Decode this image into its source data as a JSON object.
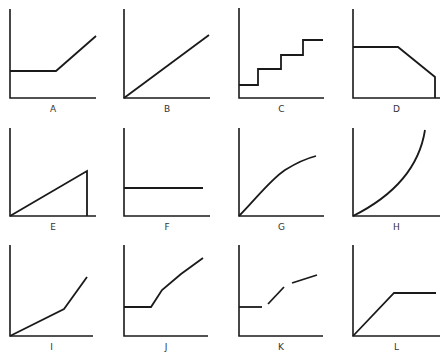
{
  "figure": {
    "line_color": "#1a1a1a",
    "label_color": "#333333"
  },
  "panels": [
    {
      "label": "A",
      "shape": "flat then linear rise",
      "origin": [
        10,
        98
      ],
      "x_end": 96,
      "y_top": 9,
      "segments": [
        [
          [
            10,
            71
          ],
          [
            56,
            71
          ],
          [
            96,
            36
          ]
        ]
      ]
    },
    {
      "label": "B",
      "shape": "straight line through origin",
      "origin": [
        124,
        98
      ],
      "x_end": 210,
      "y_top": 9,
      "segments": [
        [
          [
            124,
            98
          ],
          [
            209,
            35
          ]
        ]
      ]
    },
    {
      "label": "C",
      "shape": "step function",
      "origin": [
        239,
        98
      ],
      "x_end": 324,
      "y_top": 8,
      "segments": [
        [
          [
            239,
            85
          ],
          [
            258,
            85
          ],
          [
            258,
            69
          ],
          [
            281,
            69
          ],
          [
            281,
            55
          ],
          [
            303,
            55
          ],
          [
            303,
            40
          ],
          [
            323,
            40
          ]
        ]
      ]
    },
    {
      "label": "D",
      "shape": "flat then decreasing then drop to zero",
      "origin": [
        353,
        98
      ],
      "x_end": 440,
      "y_top": 9,
      "segments": [
        [
          [
            353,
            47
          ],
          [
            398,
            47
          ],
          [
            435,
            77
          ],
          [
            435,
            98
          ]
        ]
      ]
    },
    {
      "label": "E",
      "shape": "linear rise then drop to zero",
      "origin": [
        10,
        216
      ],
      "x_end": 96,
      "y_top": 128,
      "segments": [
        [
          [
            10,
            216
          ],
          [
            87,
            171
          ],
          [
            87,
            216
          ]
        ]
      ]
    },
    {
      "label": "F",
      "shape": "constant horizontal line",
      "origin": [
        124,
        216
      ],
      "x_end": 210,
      "y_top": 128,
      "segments": [
        [
          [
            124,
            188
          ],
          [
            203,
            188
          ]
        ]
      ]
    },
    {
      "label": "G",
      "shape": "concave increasing curve",
      "origin": [
        239,
        216
      ],
      "x_end": 324,
      "y_top": 128,
      "curve": "M239,216 C255,200 270,180 285,170 C298,162 308,158 316,156"
    },
    {
      "label": "H",
      "shape": "convex increasing curve",
      "origin": [
        353,
        216
      ],
      "x_end": 440,
      "y_top": 128,
      "curve": "M353,216 C385,200 418,175 425,130"
    },
    {
      "label": "I",
      "shape": "two-slope increasing line",
      "origin": [
        10,
        336
      ],
      "x_end": 93,
      "y_top": 245,
      "segments": [
        [
          [
            10,
            336
          ],
          [
            64,
            309
          ],
          [
            87,
            277
          ]
        ]
      ]
    },
    {
      "label": "J",
      "shape": "flat then increasing with decreasing slope",
      "origin": [
        124,
        336
      ],
      "x_end": 208,
      "y_top": 245,
      "segments": [
        [
          [
            124,
            307
          ],
          [
            151,
            307
          ],
          [
            162,
            290
          ],
          [
            181,
            274
          ],
          [
            203,
            258
          ]
        ]
      ]
    },
    {
      "label": "K",
      "shape": "discontinuous piecewise increasing",
      "origin": [
        239,
        336
      ],
      "x_end": 323,
      "y_top": 245,
      "segments": [
        [
          [
            239,
            307
          ],
          [
            262,
            307
          ]
        ],
        [
          [
            268,
            304
          ],
          [
            284,
            287
          ]
        ],
        [
          [
            292,
            283
          ],
          [
            317,
            275
          ]
        ]
      ]
    },
    {
      "label": "L",
      "shape": "linear rise then plateau",
      "origin": [
        353,
        336
      ],
      "x_end": 440,
      "y_top": 245,
      "segments": [
        [
          [
            353,
            336
          ],
          [
            394,
            293
          ],
          [
            436,
            293
          ]
        ]
      ]
    }
  ],
  "chart_data": {
    "type": "line",
    "title": "",
    "panels": [
      "A",
      "B",
      "C",
      "D",
      "E",
      "F",
      "G",
      "H",
      "I",
      "J",
      "K",
      "L"
    ],
    "grid": false,
    "legend": "none"
  }
}
